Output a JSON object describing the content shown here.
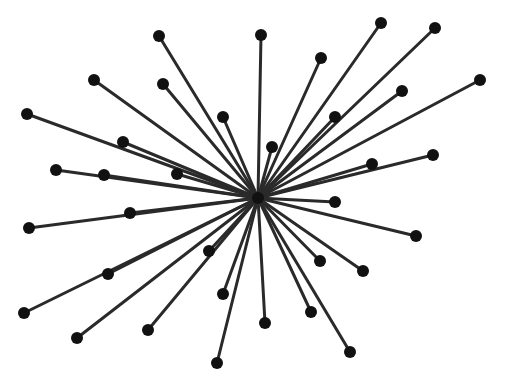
{
  "diagram": {
    "type": "star-graph",
    "colors": {
      "edge": "#2a2a2a",
      "node": "#111111",
      "background": "#ffffff"
    },
    "hub": {
      "id": "hub",
      "x": 258,
      "y": 198,
      "r": 6
    },
    "node_radius": 6,
    "nodes": [
      {
        "id": "n1",
        "x": 159,
        "y": 36
      },
      {
        "id": "n2",
        "x": 261,
        "y": 35
      },
      {
        "id": "n3",
        "x": 381,
        "y": 23
      },
      {
        "id": "n4",
        "x": 435,
        "y": 28
      },
      {
        "id": "n5",
        "x": 94,
        "y": 80
      },
      {
        "id": "n6",
        "x": 163,
        "y": 84
      },
      {
        "id": "n7",
        "x": 321,
        "y": 58
      },
      {
        "id": "n8",
        "x": 480,
        "y": 80
      },
      {
        "id": "n9",
        "x": 27,
        "y": 114
      },
      {
        "id": "n10",
        "x": 223,
        "y": 117
      },
      {
        "id": "n11",
        "x": 402,
        "y": 91
      },
      {
        "id": "n12",
        "x": 335,
        "y": 117
      },
      {
        "id": "n13",
        "x": 123,
        "y": 142
      },
      {
        "id": "n14",
        "x": 272,
        "y": 147
      },
      {
        "id": "n15",
        "x": 433,
        "y": 155
      },
      {
        "id": "n16",
        "x": 56,
        "y": 170
      },
      {
        "id": "n17",
        "x": 104,
        "y": 175
      },
      {
        "id": "n18",
        "x": 177,
        "y": 174
      },
      {
        "id": "n19",
        "x": 372,
        "y": 164
      },
      {
        "id": "n20",
        "x": 335,
        "y": 202
      },
      {
        "id": "n21",
        "x": 130,
        "y": 213
      },
      {
        "id": "n22",
        "x": 29,
        "y": 228
      },
      {
        "id": "n23",
        "x": 416,
        "y": 236
      },
      {
        "id": "n24",
        "x": 209,
        "y": 251
      },
      {
        "id": "n25",
        "x": 320,
        "y": 261
      },
      {
        "id": "n26",
        "x": 363,
        "y": 271
      },
      {
        "id": "n27",
        "x": 108,
        "y": 274
      },
      {
        "id": "n28",
        "x": 223,
        "y": 294
      },
      {
        "id": "n29",
        "x": 311,
        "y": 312
      },
      {
        "id": "n30",
        "x": 24,
        "y": 313
      },
      {
        "id": "n31",
        "x": 265,
        "y": 323
      },
      {
        "id": "n32",
        "x": 148,
        "y": 330
      },
      {
        "id": "n33",
        "x": 77,
        "y": 338
      },
      {
        "id": "n34",
        "x": 350,
        "y": 352
      },
      {
        "id": "n35",
        "x": 217,
        "y": 363
      }
    ]
  }
}
